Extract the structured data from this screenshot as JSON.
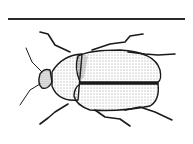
{
  "figure": {
    "style": "stippled line drawing",
    "colors": {
      "ink": "#1a1a1a",
      "background": "#ffffff"
    }
  }
}
